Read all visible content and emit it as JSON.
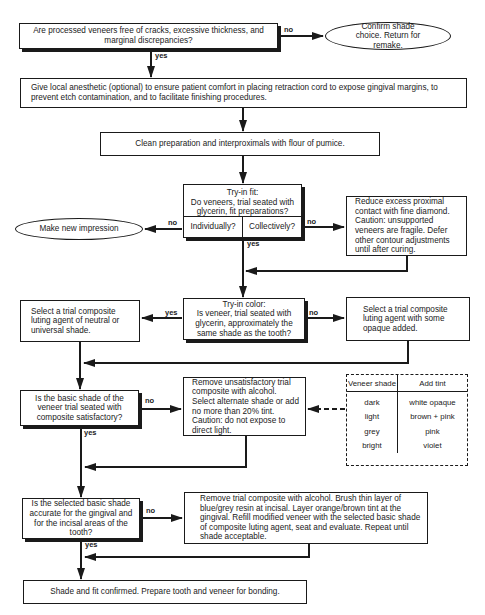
{
  "diagram": {
    "start": {
      "question": "Are processed veneers free of cracks, excessive thickness, and marginal discrepancies?"
    },
    "remake": {
      "text": "Confirm shade choice. Return for remake."
    },
    "anesthetic": {
      "text": "Give local anesthetic (optional) to ensure patient comfort in placing retraction cord to expose gingival margins, to prevent etch contamination, and to facilitate finishing procedures."
    },
    "clean": {
      "text": "Clean preparation and interproximals with flour of pumice."
    },
    "tryin_fit": {
      "title": "Try-in fit:",
      "question": "Do veneers, trial seated with glycerin, fit preparations?",
      "left": "Individually?",
      "right": "Collectively?"
    },
    "new_impression": {
      "text": "Make new impression"
    },
    "reduce": {
      "text": "Reduce excess proximal contact with fine diamond. Caution: unsupported veneers are fragile. Defer other contour adjustments until after curing."
    },
    "tryin_color": {
      "title": "Try-in color:",
      "question": "Is veneer, trial seated with glycerin, approximately the same shade as the tooth?"
    },
    "neutral": {
      "text": "Select a trial composite luting agent of neutral or universal shade."
    },
    "opaque": {
      "text": "Select a trial composite luting agent with some opaque added."
    },
    "basic_shade": {
      "question": "Is the basic shade of the veneer trial seated with composite satisfactory?"
    },
    "remove_unsat": {
      "text": "Remove unsatisfactory trial composite with alcohol. Select alternate shade or add no more than 20% tint. Caution: do not expose to direct light."
    },
    "tint_table": {
      "headers": [
        "Veneer shade",
        "Add tint"
      ],
      "rows": [
        [
          "dark",
          "white opaque"
        ],
        [
          "light",
          "brown + pink"
        ],
        [
          "grey",
          "pink"
        ],
        [
          "bright",
          "violet"
        ]
      ]
    },
    "selected_shade": {
      "question": "Is the selected basic shade accurate for the gingival and for the incisal areas of the tooth?"
    },
    "remove_layer": {
      "text": "Remove trial composite with alcohol. Brush thin layer of blue/grey resin at incisal. Layer orange/brown tint at the gingival. Refill modified veneer with the selected basic shade of composite luting agent, seat and evaluate. Repeat until shade acceptable."
    },
    "final": {
      "text": "Shade and fit confirmed. Prepare tooth and veneer for bonding."
    },
    "labels": {
      "yes": "yes",
      "no": "no"
    }
  }
}
